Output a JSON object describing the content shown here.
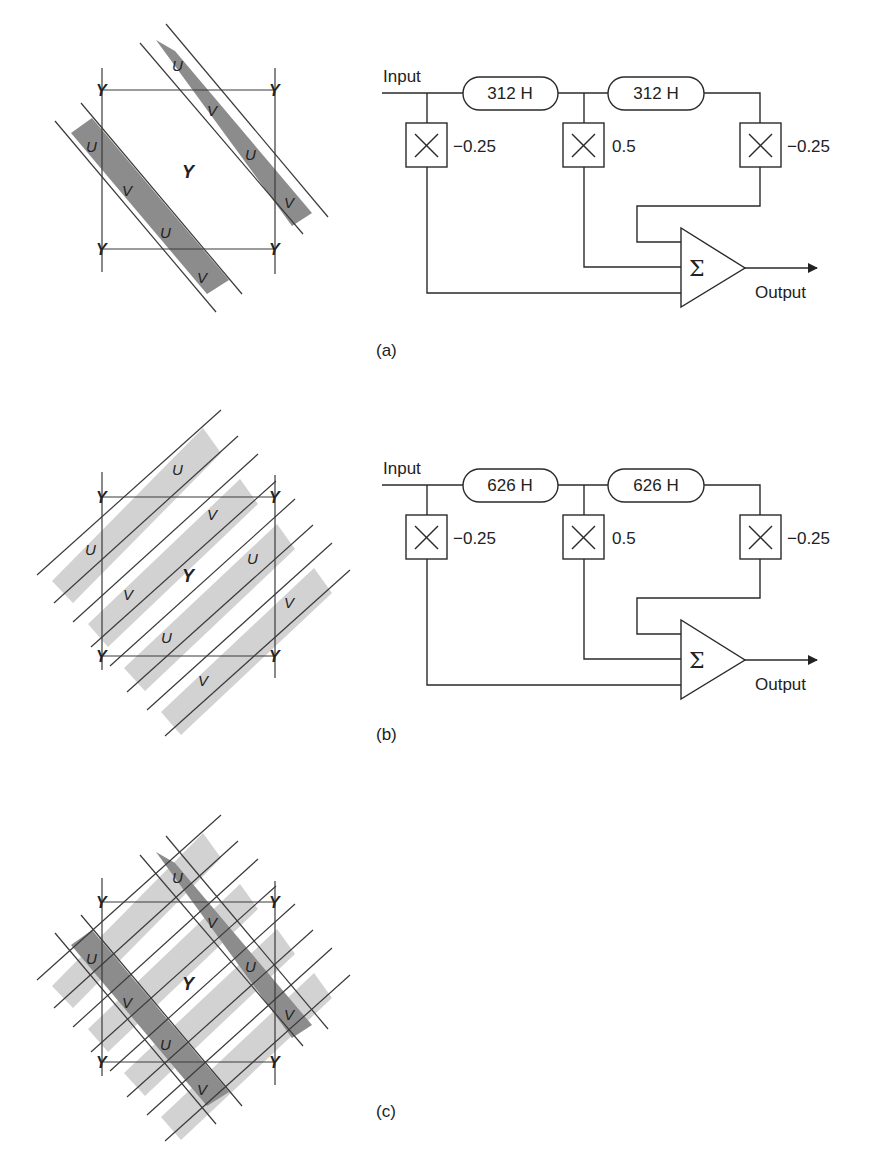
{
  "figures": [
    {
      "id": "a",
      "caption": "(a)",
      "pattern": {
        "center_label": "Y",
        "corner_label": "Y",
        "band_type": "dark",
        "band_labels": [
          "U",
          "V",
          "U",
          "V",
          "U",
          "V",
          "U",
          "V"
        ]
      },
      "block_diagram": {
        "input_label": "Input",
        "output_label": "Output",
        "delay1_label": "312 H",
        "delay2_label": "312 H",
        "coef1": "−0.25",
        "coef2": "0.5",
        "coef3": "−0.25",
        "sum_symbol": "Σ"
      }
    },
    {
      "id": "b",
      "caption": "(b)",
      "pattern": {
        "center_label": "Y",
        "corner_label": "Y",
        "band_type": "light",
        "band_labels": [
          "U",
          "U",
          "V",
          "V",
          "U",
          "U",
          "V",
          "V"
        ]
      },
      "block_diagram": {
        "input_label": "Input",
        "output_label": "Output",
        "delay1_label": "626 H",
        "delay2_label": "626 H",
        "coef1": "−0.25",
        "coef2": "0.5",
        "coef3": "−0.25",
        "sum_symbol": "Σ"
      }
    },
    {
      "id": "c",
      "caption": "(c)",
      "pattern": {
        "center_label": "Y",
        "corner_label": "Y",
        "band_type": "combined",
        "band_labels": [
          "U",
          "V",
          "U",
          "V",
          "U",
          "V",
          "U",
          "V"
        ]
      }
    }
  ],
  "colors": {
    "dark_band": "#8c8c8c",
    "light_band": "#d2d2d2",
    "line": "#2a2a2a"
  }
}
